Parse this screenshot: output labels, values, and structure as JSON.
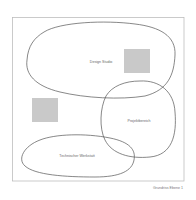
{
  "diagram": {
    "type": "floor-plan-bubble-diagram",
    "caption": "Grundriss Ebene 1",
    "colors": {
      "frame": "#bdbdbd",
      "zone_outline": "#555555",
      "block_fill": "#c9c9c9",
      "label": "#666666",
      "background": "#ffffff"
    },
    "zones": [
      {
        "id": "design-studio",
        "label": "Design Studio"
      },
      {
        "id": "projektbereich",
        "label": "Projektbereich"
      },
      {
        "id": "technische-werkstatt",
        "label": "Technischer Werkstatt"
      }
    ],
    "blocks": [
      {
        "id": "block-upper-right",
        "description": "gray square"
      },
      {
        "id": "block-left",
        "description": "gray square"
      }
    ]
  }
}
